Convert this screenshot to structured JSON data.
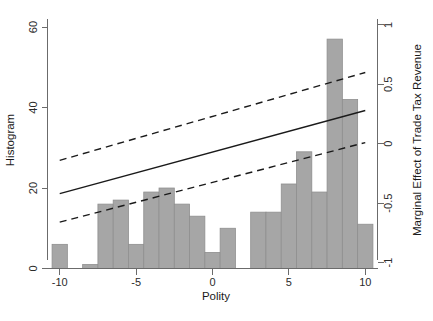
{
  "chart_data": {
    "type": "bar",
    "title": "",
    "subtitle": "",
    "xlabel": "Polity",
    "ylabel": "Histogram",
    "y2label": "Marginal Effect of Trade Tax Revenue",
    "xlim": [
      -10.8,
      10.8
    ],
    "ylim": [
      0,
      62
    ],
    "y2lim": [
      -1.05,
      1.05
    ],
    "grid": false,
    "legend": null,
    "xticks": [
      -10,
      -5,
      0,
      5,
      10
    ],
    "xticklabels": [
      "-10",
      "-5",
      "0",
      "5",
      "10"
    ],
    "yticks": [
      0,
      20,
      40,
      60
    ],
    "yticklabels": [
      "0",
      "20",
      "40",
      "60"
    ],
    "y2ticks": [
      -1,
      -0.5,
      0,
      0.5,
      1
    ],
    "y2ticklabels": [
      "-1",
      "-0.5",
      "0",
      "0.5",
      "1"
    ],
    "categories": [
      -10,
      -9,
      -8,
      -7,
      -6,
      -5,
      -4,
      -3,
      -2,
      -1,
      0,
      1,
      2,
      3,
      4,
      5,
      6,
      7,
      8,
      9,
      10
    ],
    "bar_width": 1,
    "values": [
      6,
      0,
      1,
      16,
      17,
      6,
      19,
      20,
      16,
      13,
      4,
      10,
      0,
      14,
      14,
      21,
      29,
      19,
      57,
      42,
      11
    ],
    "series": [
      {
        "name": "Marginal effect (fit)",
        "style": "solid",
        "axis": "right",
        "x": [
          -10,
          10
        ],
        "values": [
          -0.42,
          0.28
        ]
      },
      {
        "name": "Upper 95% confidence bound",
        "style": "dashed",
        "axis": "right",
        "x": [
          -10,
          10
        ],
        "values": [
          -0.14,
          0.6
        ]
      },
      {
        "name": "Lower 95% confidence bound",
        "style": "dashed",
        "axis": "right",
        "x": [
          -10,
          10
        ],
        "values": [
          -0.66,
          0.01
        ]
      }
    ],
    "colors": {
      "bar_fill": "#a6a6a6",
      "bar_stroke": "#8f8f8f",
      "line": "#1a1a1a",
      "axis": "#6b6b6b",
      "background": "#ffffff"
    }
  }
}
